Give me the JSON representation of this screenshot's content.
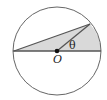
{
  "diagram": {
    "labels": {
      "center": "O",
      "angle": "θ"
    },
    "colors": {
      "stroke": "#555555",
      "fill": "#d9d9d9",
      "point": "#111111",
      "background": "#ffffff"
    }
  }
}
